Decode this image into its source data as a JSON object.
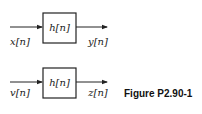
{
  "diagram": {
    "systems": [
      {
        "input_label": "x[n]",
        "block_label": "h[n]",
        "output_label": "y[n]"
      },
      {
        "input_label": "v[n]",
        "block_label": "h[n]",
        "output_label": "z[n]"
      }
    ],
    "caption": "Figure P2.90-1"
  }
}
